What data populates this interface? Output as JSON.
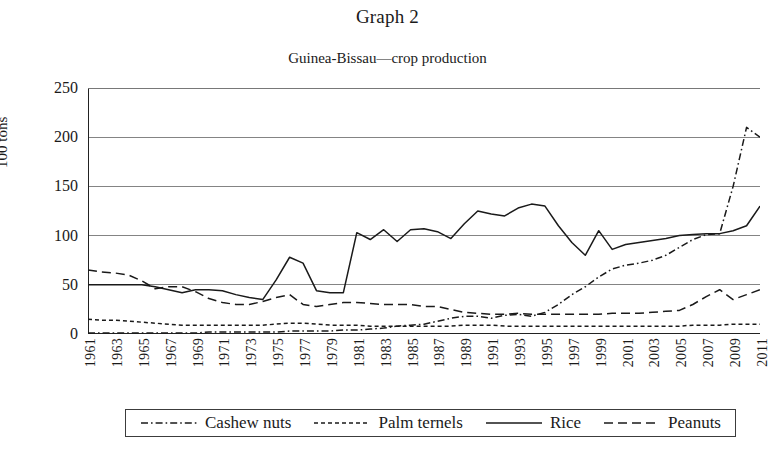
{
  "figure": {
    "graph_title": "Graph 2",
    "ylabel": "100 tons"
  },
  "legend": {
    "items": [
      {
        "label": "Cashew nuts",
        "style": "dash-dot"
      },
      {
        "label": "Palm ternels",
        "style": "short-dash"
      },
      {
        "label": "Rice",
        "style": "solid"
      },
      {
        "label": "Peanuts",
        "style": "long-dash"
      }
    ]
  },
  "chart_data": {
    "type": "line",
    "title": "Guinea-Bissau—crop production",
    "xlabel": "",
    "ylabel": "100 tons",
    "ylim": [
      0,
      250
    ],
    "yticks": [
      0,
      50,
      100,
      150,
      200,
      250
    ],
    "grid": true,
    "legend_position": "below-axes",
    "x": [
      1961,
      1962,
      1963,
      1964,
      1965,
      1966,
      1967,
      1968,
      1969,
      1970,
      1971,
      1972,
      1973,
      1974,
      1975,
      1976,
      1977,
      1978,
      1979,
      1980,
      1981,
      1982,
      1983,
      1984,
      1985,
      1986,
      1987,
      1988,
      1989,
      1990,
      1991,
      1992,
      1993,
      1994,
      1995,
      1996,
      1997,
      1998,
      1999,
      2000,
      2001,
      2002,
      2003,
      2004,
      2005,
      2006,
      2007,
      2008,
      2009,
      2010,
      2011
    ],
    "xtick_labels": [
      "1961",
      "1963",
      "1965",
      "1967",
      "1969",
      "1971",
      "1973",
      "1975",
      "1977",
      "1979",
      "1981",
      "1983",
      "1985",
      "1987",
      "1989",
      "1991",
      "1993",
      "1995",
      "1997",
      "1999",
      "2001",
      "2003",
      "2005",
      "2007",
      "2009",
      "2011"
    ],
    "series": [
      {
        "name": "Cashew nuts",
        "style": "dash-dot",
        "values": [
          1,
          1,
          1,
          1,
          1,
          1,
          1,
          1,
          1,
          2,
          2,
          2,
          2,
          2,
          2,
          3,
          3,
          3,
          3,
          4,
          4,
          5,
          6,
          8,
          9,
          10,
          13,
          16,
          18,
          18,
          16,
          19,
          20,
          18,
          22,
          30,
          40,
          48,
          58,
          66,
          70,
          72,
          75,
          80,
          88,
          96,
          101,
          102,
          150,
          210,
          200
        ]
      },
      {
        "name": "Palm ternels",
        "style": "short-dash",
        "values": [
          15,
          14,
          14,
          13,
          12,
          11,
          10,
          9,
          9,
          9,
          9,
          9,
          9,
          9,
          10,
          11,
          11,
          10,
          9,
          9,
          9,
          8,
          8,
          8,
          8,
          8,
          8,
          8,
          9,
          9,
          9,
          8,
          8,
          8,
          8,
          8,
          8,
          8,
          8,
          8,
          8,
          8,
          8,
          8,
          8,
          9,
          9,
          9,
          10,
          10,
          10
        ]
      },
      {
        "name": "Rice",
        "style": "solid",
        "values": [
          50,
          50,
          50,
          50,
          50,
          48,
          45,
          42,
          45,
          45,
          44,
          40,
          37,
          35,
          55,
          78,
          72,
          44,
          42,
          42,
          103,
          96,
          106,
          94,
          106,
          107,
          104,
          97,
          112,
          125,
          122,
          120,
          128,
          132,
          130,
          110,
          93,
          80,
          105,
          86,
          91,
          93,
          95,
          97,
          100,
          101,
          102,
          102,
          105,
          110,
          130
        ]
      },
      {
        "name": "Peanuts",
        "style": "long-dash",
        "values": [
          65,
          63,
          62,
          60,
          54,
          46,
          48,
          48,
          43,
          36,
          32,
          30,
          30,
          33,
          37,
          40,
          30,
          28,
          30,
          32,
          32,
          31,
          30,
          30,
          30,
          28,
          28,
          25,
          22,
          21,
          20,
          20,
          21,
          20,
          20,
          20,
          20,
          20,
          20,
          21,
          21,
          21,
          22,
          23,
          24,
          30,
          38,
          45,
          35,
          40,
          45
        ]
      }
    ]
  }
}
